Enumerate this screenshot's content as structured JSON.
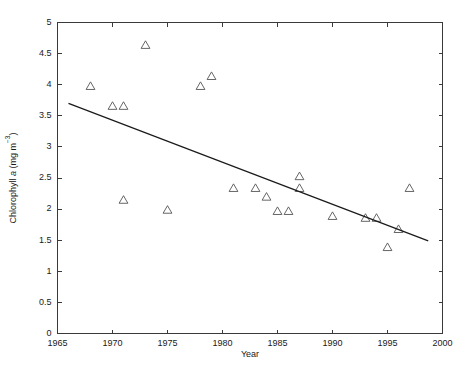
{
  "chart_data": {
    "type": "scatter",
    "title": "",
    "xlabel": "Year",
    "ylabel": "Chlorophyll a (mg m-3)",
    "ylabel_parts": {
      "prefix": "Chlorophyll ",
      "italic": "a",
      "middle": " (mg m",
      "superscript": "−3",
      "suffix": ")"
    },
    "xlim": [
      1965,
      2000
    ],
    "ylim": [
      0,
      5
    ],
    "grid": false,
    "legend": null,
    "xticks": [
      1965,
      1970,
      1975,
      1980,
      1985,
      1990,
      1995,
      2000
    ],
    "xticklabels": [
      "1965",
      "1970",
      "1975",
      "1980",
      "1985",
      "1990",
      "1995",
      "2000"
    ],
    "yticks": [
      0,
      0.5,
      1,
      1.5,
      2,
      2.5,
      3,
      3.5,
      4,
      4.5,
      5
    ],
    "yticklabels": [
      "0",
      "0.5",
      "1",
      "1.5",
      "2",
      "2.5",
      "3",
      "3.5",
      "4",
      "4.5",
      "5"
    ],
    "marker_style": "open-triangle",
    "series": [
      {
        "name": "Chlorophyll a observations",
        "marker": "triangle",
        "points": [
          {
            "x": 1968,
            "y": 3.97
          },
          {
            "x": 1970,
            "y": 3.65
          },
          {
            "x": 1971,
            "y": 3.65
          },
          {
            "x": 1971,
            "y": 2.14
          },
          {
            "x": 1973,
            "y": 4.63
          },
          {
            "x": 1975,
            "y": 1.98
          },
          {
            "x": 1978,
            "y": 3.97
          },
          {
            "x": 1979,
            "y": 4.13
          },
          {
            "x": 1981,
            "y": 2.33
          },
          {
            "x": 1983,
            "y": 2.33
          },
          {
            "x": 1984,
            "y": 2.19
          },
          {
            "x": 1985,
            "y": 1.96
          },
          {
            "x": 1986,
            "y": 1.96
          },
          {
            "x": 1987,
            "y": 2.52
          },
          {
            "x": 1987,
            "y": 2.33
          },
          {
            "x": 1990,
            "y": 1.88
          },
          {
            "x": 1993,
            "y": 1.85
          },
          {
            "x": 1994,
            "y": 1.85
          },
          {
            "x": 1995,
            "y": 1.38
          },
          {
            "x": 1996,
            "y": 1.67
          },
          {
            "x": 1997,
            "y": 2.33
          }
        ]
      }
    ],
    "trend_line": {
      "name": "linear regression",
      "x_start": 1966.0,
      "y_start": 3.7,
      "x_end": 1998.7,
      "y_end": 1.49
    }
  }
}
